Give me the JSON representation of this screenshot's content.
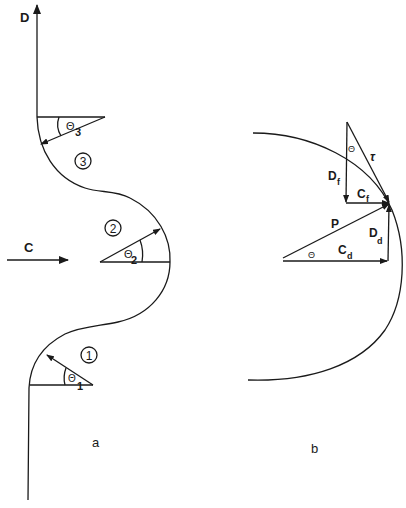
{
  "panel_a": {
    "caption": "a",
    "flow_arrow_label": "C",
    "draw_arrow_label": "D",
    "zones": [
      {
        "number": "1",
        "angle_symbol": "Θ",
        "angle_subscript": "1"
      },
      {
        "number": "2",
        "angle_symbol": "Θ",
        "angle_subscript": "2"
      },
      {
        "number": "3",
        "angle_symbol": "Θ",
        "angle_subscript": "3"
      }
    ]
  },
  "panel_b": {
    "caption": "b",
    "vectors": {
      "tau": "τ",
      "d_f": {
        "main": "D",
        "sub": "f"
      },
      "c_f": {
        "main": "C",
        "sub": "f"
      },
      "p": "P",
      "c_d": {
        "main": "C",
        "sub": "d"
      },
      "d_d": {
        "main": "D",
        "sub": "d"
      }
    },
    "angle_upper": "Θ",
    "angle_lower": "Θ"
  },
  "colors": {
    "ink": "#1a1a1a",
    "background": "#ffffff"
  }
}
